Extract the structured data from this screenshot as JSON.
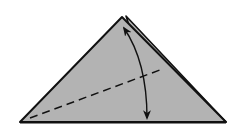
{
  "diagram": {
    "type": "origami-fold-step",
    "colors": {
      "paper": "#b3b3b3",
      "outline": "#111111",
      "background": "#ffffff"
    },
    "elements": [
      {
        "name": "folded-triangle",
        "description": "gray triangular paper with layered right edge"
      },
      {
        "name": "valley-fold-line",
        "style": "dashed",
        "description": "diagonal crease from lower-left to right edge"
      },
      {
        "name": "fold-arrow",
        "style": "double-headed curved",
        "description": "fold apex down and unfold"
      }
    ]
  }
}
